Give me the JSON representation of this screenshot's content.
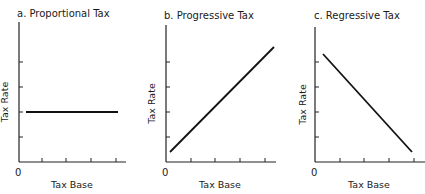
{
  "chart_data": [
    {
      "type": "line",
      "title": "a. Proportional Tax",
      "xlabel": "Tax Base",
      "ylabel": "Tax Rate",
      "origin_label": "0",
      "grid": false,
      "x_ticks": 4,
      "y_ticks": 4,
      "xlim": [
        0,
        5
      ],
      "ylim": [
        0,
        5.5
      ],
      "series": [
        {
          "name": "Proportional",
          "x": [
            0.3,
            4.0
          ],
          "y": [
            2.0,
            2.0
          ]
        }
      ],
      "geometry": {
        "ox": 19,
        "oy": 162,
        "xend": 126,
        "ytop": 22,
        "xticks": [
          42,
          66,
          91,
          116
        ],
        "yticks": [
          62,
          87,
          112,
          137
        ],
        "line": [
          26,
          112,
          118,
          112
        ],
        "title_x": 17,
        "title_y": 17,
        "ylabel_x": 8,
        "xlabel_x": 72,
        "origin_x": 15
      }
    },
    {
      "type": "line",
      "title": "b. Progressive Tax",
      "xlabel": "Tax Base",
      "ylabel": "Tax Rate",
      "origin_label": "0",
      "grid": false,
      "x_ticks": 4,
      "y_ticks": 4,
      "xlim": [
        0,
        5
      ],
      "ylim": [
        0,
        5.5
      ],
      "series": [
        {
          "name": "Progressive",
          "x": [
            0.2,
            4.5
          ],
          "y": [
            0.4,
            4.6
          ]
        }
      ],
      "geometry": {
        "ox": 166,
        "oy": 162,
        "xend": 276,
        "ytop": 25,
        "xticks": [
          191,
          215,
          240,
          265
        ],
        "yticks": [
          62,
          87,
          112,
          137
        ],
        "line": [
          170,
          152,
          274,
          47
        ],
        "title_x": 164,
        "title_y": 19,
        "ylabel_x": 155,
        "xlabel_x": 220,
        "origin_x": 162
      }
    },
    {
      "type": "line",
      "title": "c. Regressive Tax",
      "xlabel": "Tax Base",
      "ylabel": "Tax Rate",
      "origin_label": "0",
      "grid": false,
      "x_ticks": 4,
      "y_ticks": 4,
      "xlim": [
        0,
        5
      ],
      "ylim": [
        0,
        5.5
      ],
      "series": [
        {
          "name": "Regressive",
          "x": [
            0.3,
            4.0
          ],
          "y": [
            4.3,
            0.4
          ]
        }
      ],
      "geometry": {
        "ox": 315,
        "oy": 162,
        "xend": 425,
        "ytop": 27,
        "xticks": [
          340,
          364,
          389,
          414
        ],
        "yticks": [
          62,
          87,
          112,
          137
        ],
        "line": [
          323,
          54,
          412,
          152
        ],
        "title_x": 314,
        "title_y": 19,
        "ylabel_x": 306,
        "xlabel_x": 369,
        "origin_x": 311
      }
    }
  ]
}
